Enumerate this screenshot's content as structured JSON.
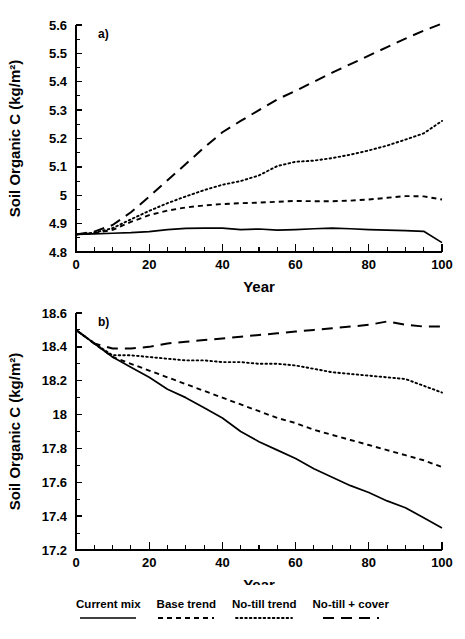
{
  "figure": {
    "axis_title_y": "Soil Organic C (kg/m²)",
    "axis_title_x": "Year",
    "panel_a_tag": "a)",
    "panel_b_tag": "b)"
  },
  "legend": {
    "items": [
      {
        "label": "Current mix",
        "style": "solid"
      },
      {
        "label": "Base trend",
        "style": "dash"
      },
      {
        "label": "No-till trend",
        "style": "dot"
      },
      {
        "label": "No-till + cover",
        "style": "longdash"
      }
    ]
  },
  "chart_data": [
    {
      "id": "panel_a",
      "type": "line",
      "title": "a)",
      "xlabel": "Year",
      "ylabel": "Soil Organic C (kg/m²)",
      "xlim": [
        0,
        100
      ],
      "ylim": [
        4.8,
        5.6
      ],
      "grid": false,
      "legend_position": "below-figure",
      "xticks": [
        0,
        10,
        20,
        30,
        40,
        50,
        60,
        70,
        80,
        90,
        100
      ],
      "xticklabels": [
        "0",
        "",
        "20",
        "",
        "40",
        "",
        "60",
        "",
        "80",
        "",
        "100"
      ],
      "yticks": [
        4.8,
        4.9,
        5.0,
        5.1,
        5.2,
        5.3,
        5.4,
        5.5,
        5.6
      ],
      "yticklabels": [
        "4.8",
        "4.9",
        "5",
        "5.1",
        "5.2",
        "5.3",
        "5.4",
        "5.5",
        "5.6"
      ],
      "x": [
        0,
        5,
        10,
        15,
        20,
        25,
        30,
        35,
        40,
        45,
        50,
        55,
        60,
        65,
        70,
        75,
        80,
        85,
        90,
        95,
        100
      ],
      "series": [
        {
          "name": "Current mix",
          "style": "solid",
          "values": [
            4.862,
            4.864,
            4.866,
            4.868,
            4.872,
            4.879,
            4.883,
            4.884,
            4.884,
            4.879,
            4.881,
            4.877,
            4.879,
            4.882,
            4.884,
            4.882,
            4.879,
            4.877,
            4.875,
            4.873,
            4.833
          ]
        },
        {
          "name": "Base trend",
          "style": "dash",
          "values": [
            4.862,
            4.866,
            4.878,
            4.906,
            4.93,
            4.946,
            4.957,
            4.964,
            4.969,
            4.972,
            4.974,
            4.977,
            4.98,
            4.979,
            4.979,
            4.981,
            4.985,
            4.991,
            4.997,
            4.996,
            4.985
          ]
        },
        {
          "name": "No-till trend",
          "style": "dot",
          "values": [
            4.862,
            4.868,
            4.884,
            4.915,
            4.945,
            4.972,
            4.996,
            5.018,
            5.037,
            5.05,
            5.07,
            5.103,
            5.118,
            5.122,
            5.131,
            5.143,
            5.158,
            5.175,
            5.196,
            5.218,
            5.262
          ]
        },
        {
          "name": "No-till + cover",
          "style": "longdash",
          "values": [
            4.862,
            4.872,
            4.895,
            4.94,
            4.995,
            5.053,
            5.11,
            5.168,
            5.222,
            5.262,
            5.3,
            5.338,
            5.368,
            5.4,
            5.432,
            5.462,
            5.492,
            5.522,
            5.552,
            5.58,
            5.605
          ]
        }
      ]
    },
    {
      "id": "panel_b",
      "type": "line",
      "title": "b)",
      "xlabel": "Year",
      "ylabel": "Soil Organic C (kg/m²)",
      "xlim": [
        0,
        100
      ],
      "ylim": [
        17.2,
        18.6
      ],
      "grid": false,
      "legend_position": "below-figure",
      "xticks": [
        0,
        10,
        20,
        30,
        40,
        50,
        60,
        70,
        80,
        90,
        100
      ],
      "xticklabels": [
        "0",
        "",
        "20",
        "",
        "40",
        "",
        "60",
        "",
        "80",
        "",
        "100"
      ],
      "yticks": [
        17.2,
        17.4,
        17.6,
        17.8,
        18.0,
        18.2,
        18.4,
        18.6
      ],
      "yticklabels": [
        "17.2",
        "17.4",
        "17.6",
        "17.8",
        "18",
        "18.2",
        "18.4",
        "18.6"
      ],
      "x": [
        0,
        5,
        10,
        15,
        20,
        25,
        30,
        35,
        40,
        45,
        50,
        55,
        60,
        65,
        70,
        75,
        80,
        85,
        90,
        95,
        100
      ],
      "series": [
        {
          "name": "Current mix",
          "style": "solid",
          "values": [
            18.5,
            18.42,
            18.34,
            18.28,
            18.22,
            18.15,
            18.1,
            18.04,
            17.98,
            17.9,
            17.84,
            17.79,
            17.74,
            17.68,
            17.63,
            17.58,
            17.54,
            17.49,
            17.45,
            17.39,
            17.33
          ]
        },
        {
          "name": "Base trend",
          "style": "dash",
          "values": [
            18.5,
            18.42,
            18.34,
            18.3,
            18.26,
            18.22,
            18.18,
            18.14,
            18.1,
            18.06,
            18.02,
            17.98,
            17.95,
            17.91,
            17.88,
            17.85,
            17.82,
            17.79,
            17.76,
            17.73,
            17.69
          ]
        },
        {
          "name": "No-till trend",
          "style": "dot",
          "values": [
            18.5,
            18.42,
            18.35,
            18.35,
            18.34,
            18.33,
            18.32,
            18.32,
            18.31,
            18.31,
            18.3,
            18.3,
            18.29,
            18.27,
            18.25,
            18.24,
            18.23,
            18.22,
            18.21,
            18.17,
            18.13
          ]
        },
        {
          "name": "No-till + cover",
          "style": "longdash",
          "values": [
            18.5,
            18.42,
            18.39,
            18.39,
            18.4,
            18.42,
            18.43,
            18.44,
            18.45,
            18.46,
            18.47,
            18.48,
            18.49,
            18.5,
            18.51,
            18.52,
            18.53,
            18.55,
            18.53,
            18.52,
            18.52
          ]
        }
      ]
    }
  ]
}
